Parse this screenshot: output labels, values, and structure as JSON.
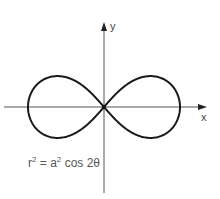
{
  "diagram": {
    "axes": {
      "x_label": "x",
      "y_label": "y"
    },
    "equation": {
      "lhs_base": "r",
      "lhs_exp": "2",
      "equals": "=",
      "coef_base": "a",
      "coef_exp": "2",
      "rhs": "cos 2θ"
    },
    "curve": {
      "type": "lemniscate",
      "stroke": "#1a1a1a",
      "a_px": 76,
      "center": [
        104,
        107
      ]
    },
    "axis_color": "#555555"
  }
}
